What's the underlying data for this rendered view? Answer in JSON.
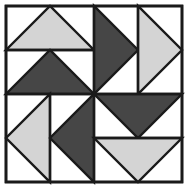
{
  "canvas": {
    "width": 188,
    "height": 190,
    "background": "#ffffff",
    "title": "Pinwheel Quilt Block"
  },
  "colors": {
    "light": "#d4d4d4",
    "dark": "#464646",
    "white": "#ffffff",
    "outline": "#1a1a1a",
    "background": "#ffffff"
  },
  "frame": {
    "x": 6,
    "y": 6,
    "width": 176,
    "height": 176,
    "stroke_width": 2.6,
    "fill": "#ffffff"
  },
  "grid": {
    "center_x": 94,
    "center_y": 94,
    "divider_stroke_width": 2.4,
    "lines": [
      {
        "name": "horizontal-midline",
        "x1": 6,
        "y1": 94,
        "x2": 182,
        "y2": 94
      },
      {
        "name": "vertical-midline",
        "x1": 94,
        "y1": 6,
        "x2": 94,
        "y2": 182
      },
      {
        "name": "top-left-inner-divider",
        "x1": 6,
        "y1": 50,
        "x2": 94,
        "y2": 50
      },
      {
        "name": "top-right-inner-divider",
        "x1": 138,
        "y1": 6,
        "x2": 138,
        "y2": 94
      },
      {
        "name": "bottom-left-inner-divider",
        "x1": 50,
        "y1": 94,
        "x2": 50,
        "y2": 182
      },
      {
        "name": "bottom-right-inner-divider",
        "x1": 94,
        "y1": 138,
        "x2": 182,
        "y2": 138
      }
    ]
  },
  "triangles": [
    {
      "id": "tl-outer-light",
      "quadrant": "top-left",
      "shade": "light",
      "fill": "#d4d4d4",
      "direction": "up",
      "points": "6,50 94,50 50,6"
    },
    {
      "id": "tl-inner-dark",
      "quadrant": "top-left",
      "shade": "dark",
      "fill": "#464646",
      "direction": "up",
      "points": "6,94 94,94 50,50"
    },
    {
      "id": "tr-inner-dark",
      "quadrant": "top-right",
      "shade": "dark",
      "fill": "#464646",
      "direction": "right",
      "points": "94,6 94,94 138,50"
    },
    {
      "id": "tr-outer-light",
      "quadrant": "top-right",
      "shade": "light",
      "fill": "#d4d4d4",
      "direction": "right",
      "points": "138,6 138,94 182,50"
    },
    {
      "id": "bl-outer-light",
      "quadrant": "bottom-left",
      "shade": "light",
      "fill": "#d4d4d4",
      "direction": "left",
      "points": "50,94 50,182 6,138"
    },
    {
      "id": "bl-inner-dark",
      "quadrant": "bottom-left",
      "shade": "dark",
      "fill": "#464646",
      "direction": "left",
      "points": "94,94 94,182 50,138"
    },
    {
      "id": "br-inner-dark",
      "quadrant": "bottom-right",
      "shade": "dark",
      "fill": "#464646",
      "direction": "down",
      "points": "94,94 182,94 138,138"
    },
    {
      "id": "br-outer-light",
      "quadrant": "bottom-right",
      "shade": "light",
      "fill": "#d4d4d4",
      "direction": "down",
      "points": "94,138 182,138 138,182"
    }
  ],
  "chart_data": {
    "type": "diagram",
    "quadrants": [
      {
        "name": "top-left",
        "direction": "up",
        "outer_shade": "light",
        "inner_shade": "dark"
      },
      {
        "name": "top-right",
        "direction": "right",
        "outer_shade": "light",
        "inner_shade": "dark"
      },
      {
        "name": "bottom-right",
        "direction": "down",
        "outer_shade": "light",
        "inner_shade": "dark"
      },
      {
        "name": "bottom-left",
        "direction": "left",
        "outer_shade": "light",
        "inner_shade": "dark"
      }
    ],
    "counts": {
      "light_triangles": 4,
      "dark_triangles": 4,
      "total_triangles": 8,
      "quadrants": 4
    }
  }
}
